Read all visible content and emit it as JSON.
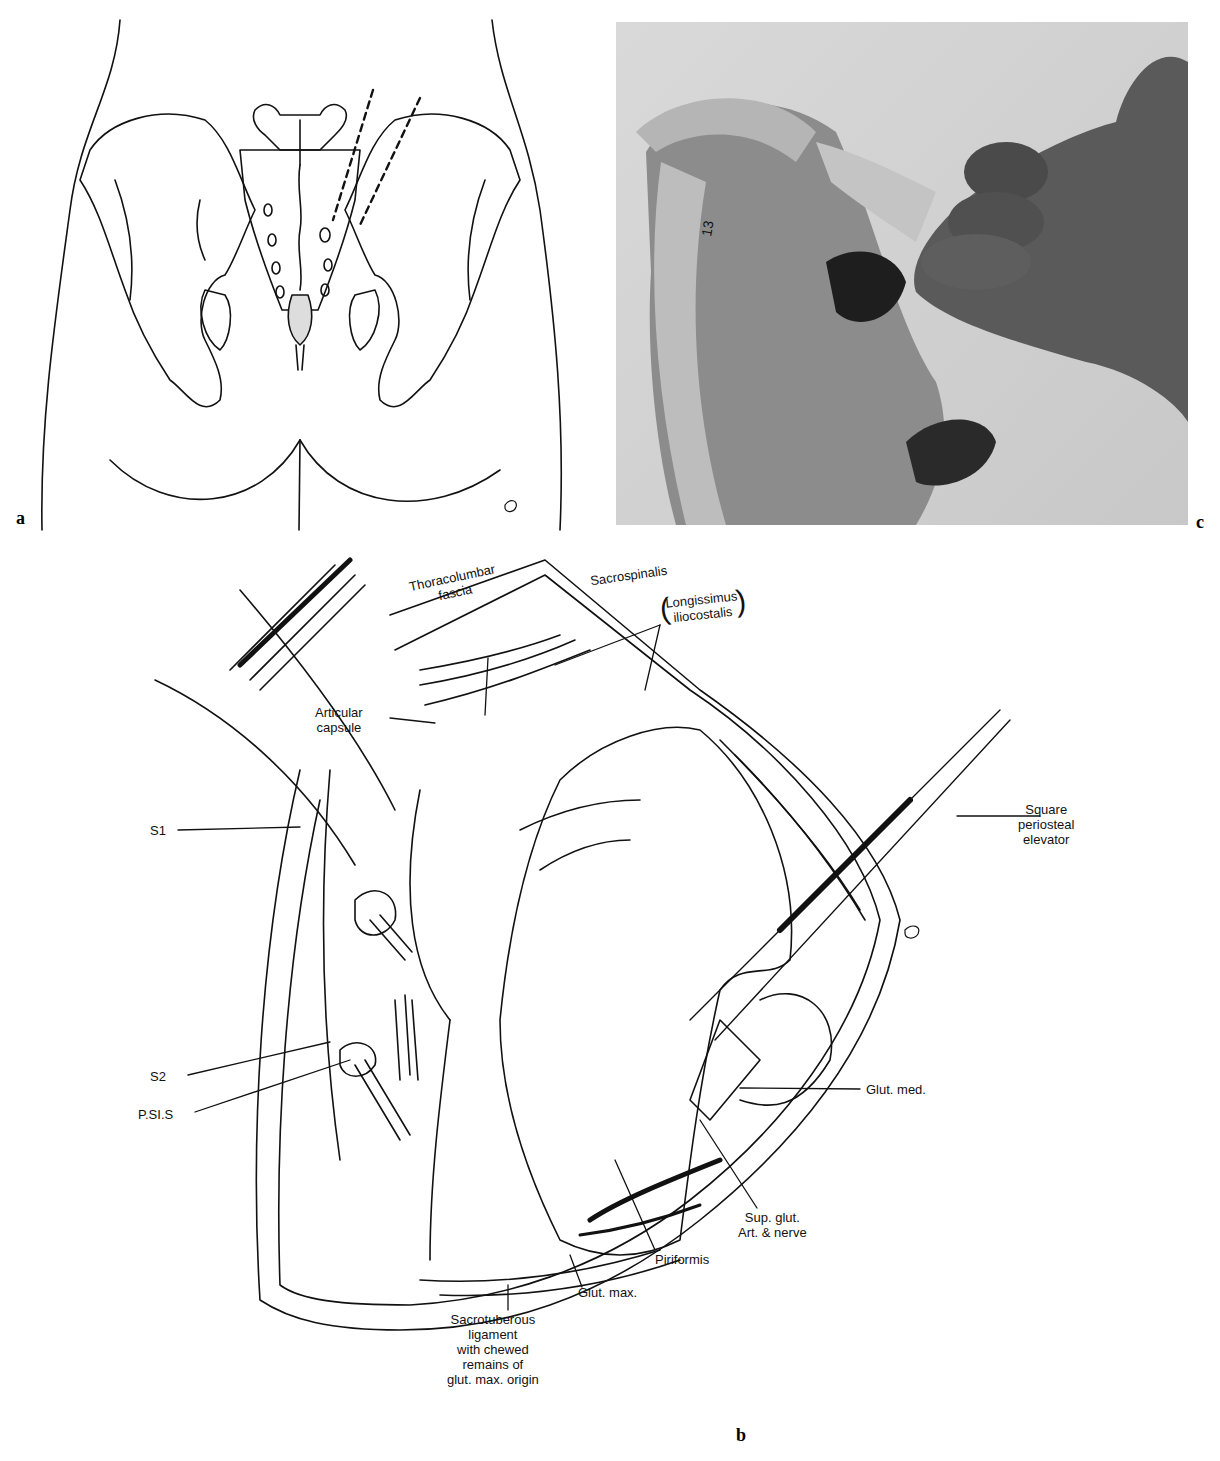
{
  "figure": {
    "panels": [
      {
        "id": "a",
        "letter": "a",
        "kind": "line-drawing",
        "subject": "posterior view of pelvis with dashed incision lines over sacroiliac region"
      },
      {
        "id": "c",
        "letter": "c",
        "kind": "photograph",
        "subject": "pelvis bone model with fingers palpating sacroiliac joint"
      },
      {
        "id": "b",
        "letter": "b",
        "kind": "line-drawing",
        "subject": "surgical exposure of posterior sacroiliac joint"
      }
    ],
    "panel_b_labels": {
      "thoracolumbar": "Thoracolumbar",
      "fascia": "fascia",
      "sacrospinalis": "Sacrospinalis",
      "longissimus": "Longissimus",
      "iliocostalis": "iliocostalis",
      "articular": "Articular",
      "capsule": "capsule",
      "square": "Square",
      "periosteal": "periosteal",
      "elevator": "elevator",
      "s1": "S1",
      "s2": "S2",
      "psis": "P.SI.S",
      "glut_med": "Glut. med.",
      "sup_glut_1": "Sup. glut.",
      "sup_glut_2": "Art. & nerve",
      "piriformis": "Piriformis",
      "glut_max": "Glut. max.",
      "sacrotuberous_1": "Sacrotuberous",
      "sacrotuberous_2": "ligament",
      "sacrotuberous_3": "with chewed",
      "sacrotuberous_4": "remains of",
      "sacrotuberous_5": "glut. max. origin"
    },
    "photo_marking": "13",
    "colors": {
      "ink": "#111111",
      "background": "#ffffff",
      "photo_gray": "#cfcfcf",
      "hand_dark": "#5a5a5a"
    }
  }
}
